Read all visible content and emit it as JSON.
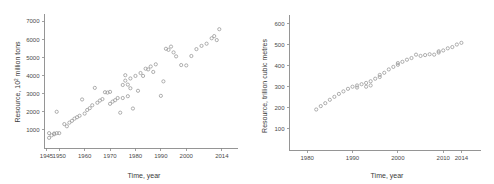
{
  "figure": {
    "background": "#ffffff",
    "marker_color": "#9a9a9a",
    "axis_color": "#8a8a8a",
    "text_color": "#3a3a3a"
  },
  "chart_data": [
    {
      "id": "left",
      "type": "scatter",
      "title": "",
      "xlabel": "Time, year",
      "ylabel_prefix": "Resource, 10",
      "ylabel_sup": "2",
      "ylabel_suffix": " million tons",
      "ylabel": "Resource, 10² million tons",
      "xlim": [
        1944,
        2018
      ],
      "ylim": [
        0,
        7400
      ],
      "xticks": [
        1945,
        1950,
        1960,
        1970,
        1980,
        1990,
        2000,
        2014
      ],
      "xtick_labels": [
        "1945",
        "1950",
        "1960",
        "1970",
        "1980",
        "1990",
        "2000",
        "2014"
      ],
      "yticks": [
        1000,
        2000,
        3000,
        4000,
        5000,
        6000,
        7000
      ],
      "ytick_labels": [
        "1000",
        "2000",
        "3000",
        "4000",
        "5000",
        "6000",
        "7000"
      ],
      "grid": false,
      "legend": "none",
      "marker": "open-circle",
      "x": [
        1946,
        1946,
        1947,
        1948,
        1948,
        1949,
        1949,
        1950,
        1952,
        1953,
        1954,
        1955,
        1956,
        1957,
        1958,
        1959,
        1960,
        1961,
        1962,
        1963,
        1964,
        1965,
        1966,
        1967,
        1968,
        1969,
        1970,
        1970,
        1971,
        1972,
        1973,
        1974,
        1975,
        1975,
        1976,
        1976,
        1977,
        1977,
        1978,
        1978,
        1979,
        1980,
        1981,
        1982,
        1983,
        1984,
        1985,
        1986,
        1987,
        1988,
        1990,
        1991,
        1992,
        1993,
        1994,
        1995,
        1996,
        1998,
        2000,
        2002,
        2004,
        2006,
        2008,
        2010,
        2011,
        2012,
        2013
      ],
      "y": [
        820,
        560,
        700,
        760,
        800,
        820,
        2000,
        820,
        1320,
        1200,
        1400,
        1500,
        1620,
        1700,
        1780,
        2680,
        1900,
        2100,
        2200,
        2360,
        3320,
        2500,
        2620,
        2700,
        3080,
        3060,
        3100,
        2440,
        2560,
        2640,
        2760,
        1950,
        3480,
        2760,
        4020,
        3720,
        3500,
        2860,
        3840,
        3300,
        2180,
        3980,
        3160,
        4140,
        3980,
        4380,
        4340,
        4500,
        4200,
        4620,
        2880,
        3680,
        5480,
        5420,
        5600,
        5280,
        5060,
        4580,
        4560,
        5080,
        5460,
        5640,
        5760,
        6060,
        6180,
        5960,
        6560
      ]
    },
    {
      "id": "right",
      "type": "scatter",
      "title": "",
      "xlabel": "Time, year",
      "ylabel": "Resource, trillion cubic metres",
      "xlim": [
        1976,
        2017
      ],
      "ylim": [
        0,
        640
      ],
      "xticks": [
        1980,
        1990,
        2000,
        2010,
        2014
      ],
      "xtick_labels": [
        "1980",
        "1990",
        "2000",
        "2010",
        "2014"
      ],
      "yticks": [
        100,
        200,
        300,
        400,
        500,
        600
      ],
      "ytick_labels": [
        "100",
        "200",
        "300",
        "400",
        "500",
        "600"
      ],
      "grid": false,
      "legend": "none",
      "marker": "open-circle",
      "x": [
        1982,
        1983,
        1984,
        1985,
        1986,
        1987,
        1988,
        1989,
        1990,
        1991,
        1991,
        1992,
        1993,
        1993,
        1994,
        1994,
        1995,
        1996,
        1996,
        1997,
        1998,
        1999,
        2000,
        2000,
        2001,
        2002,
        2003,
        2004,
        2005,
        2006,
        2007,
        2008,
        2009,
        2009,
        2010,
        2011,
        2012,
        2013,
        2014
      ],
      "y": [
        192,
        208,
        222,
        238,
        252,
        266,
        278,
        290,
        300,
        296,
        306,
        312,
        300,
        318,
        306,
        326,
        338,
        346,
        356,
        366,
        382,
        394,
        404,
        412,
        418,
        428,
        436,
        452,
        446,
        450,
        454,
        452,
        462,
        468,
        472,
        482,
        488,
        500,
        508
      ]
    }
  ]
}
